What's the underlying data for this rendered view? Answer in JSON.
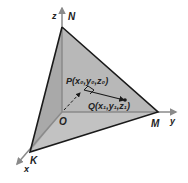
{
  "diagram": {
    "type": "tetrahedral plane in 3D coordinate system",
    "axes": {
      "x": "x",
      "y": "y",
      "z": "z"
    },
    "vertices": {
      "N": "N",
      "M": "M",
      "K": "K",
      "origin": "O"
    },
    "points": {
      "P": "P(x₀,y₀,z₀)",
      "Q": "Q(x₁,y₁,z₁)"
    },
    "colors": {
      "plane_fill": "#b4b4b4",
      "edge": "#1a1a1a",
      "axis": "#8a8a8a",
      "background": "#ffffff"
    }
  }
}
